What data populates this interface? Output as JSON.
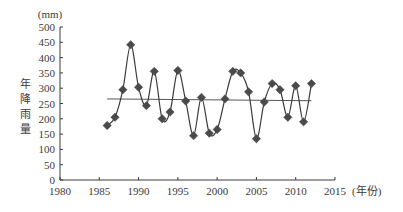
{
  "chart_data": {
    "type": "line",
    "title": "",
    "xlabel": "(年份)",
    "ylabel": "年降雨量",
    "y_unit": "(mm)",
    "xlim": [
      1980,
      2015
    ],
    "ylim": [
      0,
      500
    ],
    "x_ticks": [
      1980,
      1985,
      1990,
      1995,
      2000,
      2005,
      2010,
      2015
    ],
    "y_ticks": [
      0,
      50,
      100,
      150,
      200,
      250,
      300,
      350,
      400,
      450,
      500
    ],
    "grid": false,
    "legend": null,
    "series": [
      {
        "name": "年降雨量",
        "marker": "diamond",
        "smooth": true,
        "x": [
          1986,
          1987,
          1988,
          1989,
          1990,
          1991,
          1992,
          1993,
          1994,
          1995,
          1996,
          1997,
          1998,
          1999,
          2000,
          2001,
          2002,
          2003,
          2004,
          2005,
          2006,
          2007,
          2008,
          2009,
          2010,
          2011,
          2012
        ],
        "values": [
          178,
          205,
          295,
          442,
          303,
          243,
          355,
          200,
          222,
          358,
          258,
          145,
          270,
          153,
          165,
          265,
          355,
          350,
          288,
          135,
          255,
          315,
          295,
          205,
          308,
          190,
          315
        ]
      },
      {
        "name": "趋势线",
        "type": "linear-trend",
        "x": [
          1986,
          2012
        ],
        "values": [
          265,
          259
        ]
      }
    ]
  },
  "colors": {
    "line": "#3a3a3a",
    "marker": "#4a4a4a",
    "axis": "#3a3a3a",
    "trend": "#555555"
  }
}
